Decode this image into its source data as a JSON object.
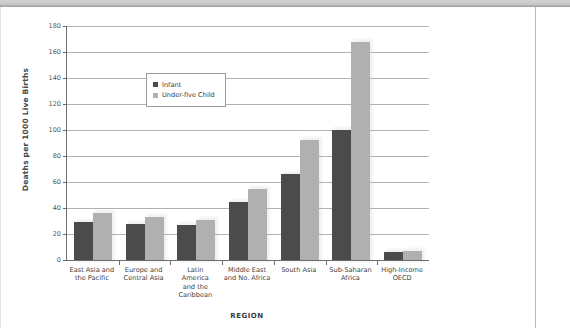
{
  "chart_data": {
    "type": "bar",
    "title": "",
    "xlabel": "REGION",
    "ylabel": "Deaths per 1000 Live Births",
    "ylim": [
      0,
      180
    ],
    "yticks": [
      0,
      20,
      40,
      60,
      80,
      100,
      120,
      140,
      160,
      180
    ],
    "grid": true,
    "legend_position": "upper-left-inside",
    "categories": [
      "East Asia and the Pacific",
      "Europe and Central Asia",
      "Latin America and the Caribbean",
      "Middle East and No. Africa",
      "South Asia",
      "Sub-Saharan Africa",
      "High-Income OECD"
    ],
    "category_lines": [
      [
        "East Asia and",
        "the Pacific"
      ],
      [
        "Europe and",
        "Central Asia"
      ],
      [
        "Latin",
        "America",
        "and the",
        "Caribbean"
      ],
      [
        "Middle East",
        "and No. Africa"
      ],
      [
        "South Asia"
      ],
      [
        "Sub-Saharan",
        "Africa"
      ],
      [
        "High-Income",
        "OECD"
      ]
    ],
    "series": [
      {
        "name": "Infant",
        "color": "#4b4b4b",
        "values": [
          29,
          28,
          27,
          45,
          66,
          100,
          6
        ]
      },
      {
        "name": "Under-five Child",
        "color": "#b0b0b0",
        "values": [
          36,
          33,
          31,
          55,
          92,
          168,
          7
        ]
      }
    ]
  },
  "legend": {
    "items": [
      {
        "label": "Infant",
        "color": "#4b4b4b"
      },
      {
        "label": "Under-five Child",
        "color": "#b0b0b0"
      }
    ]
  },
  "axes": {
    "y_title": "Deaths per 1000 Live Births",
    "x_title": "REGION"
  }
}
